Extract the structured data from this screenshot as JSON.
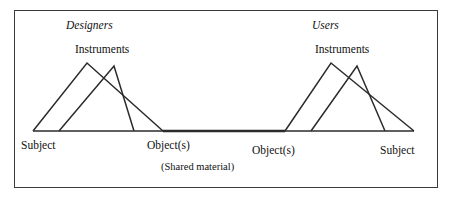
{
  "figure": {
    "title_visible": false,
    "frame": {
      "stroke": "#3a3a3a",
      "fill": "#ffffff"
    },
    "line_color": "#2b2b2b"
  },
  "labels": {
    "designers": "Designers",
    "users": "Users",
    "instruments_left": "Instruments",
    "instruments_right": "Instruments",
    "subject_left": "Subject",
    "object_left": "Object(s)",
    "object_right": "Object(s)",
    "subject_right": "Subject",
    "shared_material": "(Shared material)"
  },
  "diagram_data": {
    "type": "activity-system-pair",
    "baseline_y": 131,
    "baseline": {
      "x1": 33,
      "x2": 414
    },
    "triangles": [
      {
        "name": "designers-subject-triangle",
        "left_foot": [
          33,
          131
        ],
        "apex": [
          87,
          63
        ],
        "right_foot": [
          163,
          131
        ]
      },
      {
        "name": "designers-instrument-triangle",
        "left_foot": [
          59,
          131
        ],
        "apex": [
          114,
          66
        ],
        "right_foot": [
          134,
          131
        ]
      },
      {
        "name": "users-subject-triangle",
        "left_foot": [
          285,
          131
        ],
        "apex": [
          331,
          63
        ],
        "right_foot": [
          414,
          131
        ]
      },
      {
        "name": "users-instrument-triangle",
        "left_foot": [
          311,
          131
        ],
        "apex": [
          357,
          66
        ],
        "right_foot": [
          385,
          131
        ]
      }
    ],
    "shared_segment": {
      "x1": 163,
      "x2": 285,
      "y": 131
    }
  }
}
